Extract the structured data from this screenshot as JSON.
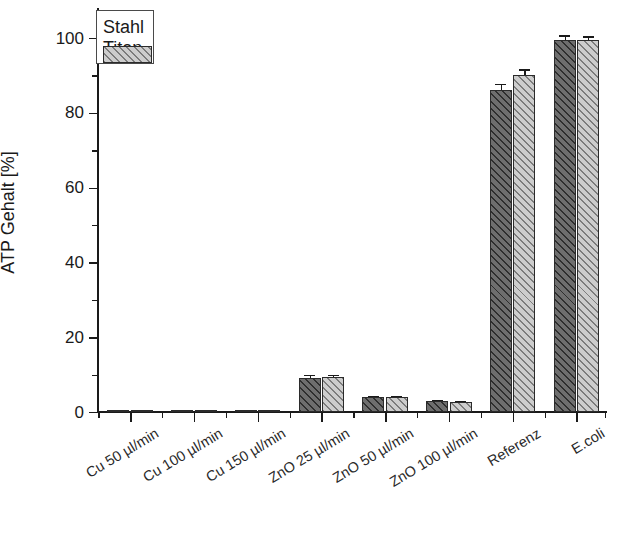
{
  "chart_data": {
    "type": "bar",
    "title": "",
    "xlabel": "",
    "ylabel": "ATP Gehalt [%]",
    "ylim": [
      0,
      108
    ],
    "y_major_ticks": [
      0,
      20,
      40,
      60,
      80,
      100
    ],
    "y_minor_ticks": [
      10,
      30,
      50,
      70,
      90
    ],
    "grid": false,
    "legend_position": "top-left",
    "categories": [
      "Cu 50 µl/min",
      "Cu 100 µl/min",
      "Cu 150 µl/min",
      "ZnO 25 µl/min",
      "ZnO 50 µl/min",
      "ZnO 100 µl/min",
      "Referenz",
      "E.coli"
    ],
    "series": [
      {
        "name": "Stahl",
        "color": "#6e6e6e",
        "hatch": "diagonal",
        "values": [
          0.3,
          0.3,
          0.3,
          9.2,
          4.0,
          3.0,
          86.0,
          99.5
        ],
        "errors": [
          0.2,
          0.2,
          0.2,
          0.8,
          0.4,
          0.3,
          1.8,
          1.2
        ]
      },
      {
        "name": "Titan",
        "color": "#cdcdcd",
        "hatch": "diagonal",
        "values": [
          0.3,
          0.3,
          0.3,
          9.3,
          4.0,
          2.6,
          90.0,
          99.4
        ],
        "errors": [
          0.2,
          0.2,
          0.2,
          0.7,
          0.4,
          0.3,
          1.6,
          1.0
        ]
      }
    ]
  },
  "legend": {
    "items": [
      {
        "label": "Stahl"
      },
      {
        "label": "Titan"
      }
    ]
  },
  "axes": {
    "y_title": "ATP Gehalt [%]",
    "y_tick_labels": [
      "0",
      "20",
      "40",
      "60",
      "80",
      "100"
    ]
  }
}
